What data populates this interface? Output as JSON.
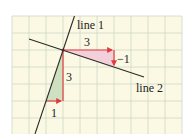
{
  "diagram": {
    "grid": {
      "origin_px": [
        12,
        16
      ],
      "cell_px": 17,
      "cols": 10,
      "rows": 7,
      "background": "#fbf9e3",
      "line_color": "#cdd8c6"
    },
    "lines": [
      {
        "name": "line 1",
        "label": "line 1",
        "color": "#2a2a2a"
      },
      {
        "name": "line 2",
        "label": "line 2",
        "color": "#2a2a2a"
      }
    ],
    "triangles": [
      {
        "name": "line-2-slope-triangle",
        "fill": "#f3cfd9",
        "run_label": "3",
        "rise_label": "−1"
      },
      {
        "name": "line-1-slope-triangle",
        "fill": "#cfe0c0",
        "run_label": "1",
        "rise_label": "3"
      }
    ],
    "arrow_color": "#e0393e",
    "labels": {
      "line1": "line 1",
      "line2": "line 2",
      "top_run": "3",
      "top_rise": "−1",
      "left_rise": "3",
      "left_run": "1"
    }
  }
}
